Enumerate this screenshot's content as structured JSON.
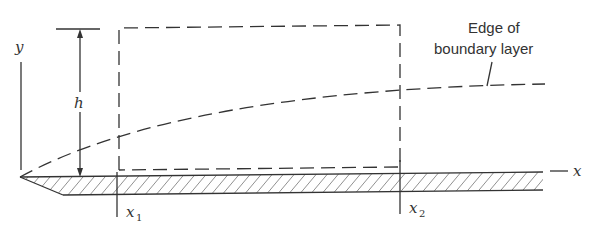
{
  "diagram": {
    "labels": {
      "y_axis": "y",
      "x_axis": "x",
      "height": "h",
      "x1_main": "x",
      "x1_sub": "1",
      "x2_main": "x",
      "x2_sub": "2",
      "annotation_line1": "Edge of",
      "annotation_line2": "boundary layer"
    },
    "elements": [
      "flat plate (hatched)",
      "dashed control volume from x1 to x2 with height h",
      "dashed boundary layer edge curve",
      "dimension arrow for h",
      "y axis",
      "x axis"
    ],
    "colors": {
      "ink": "#333333",
      "background": "#ffffff"
    }
  }
}
